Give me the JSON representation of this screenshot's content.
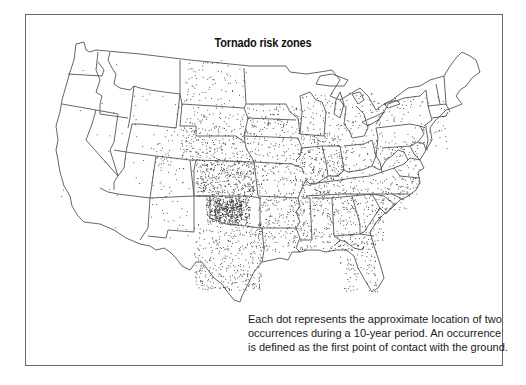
{
  "map": {
    "title": "Tornado risk zones",
    "type": "dot-density",
    "region": "Contiguous United States",
    "caption_lines": [
      "Each dot represents the approximate location of two",
      "occurrences during a 10-year period. An occurrence",
      "is defined as the first point of contact with the ground."
    ],
    "legend": {
      "dot_meaning": "approximate location of two occurrences during a 10-year period",
      "occurrence_definition": "first point of contact with the ground"
    },
    "colors": {
      "outline": "#555555",
      "dots": "#333333",
      "frame": "#6a6a6a",
      "background": "#ffffff"
    },
    "density_zones": [
      {
        "zone": "Oklahoma core",
        "density": "very high"
      },
      {
        "zone": "Kansas / north Texas / Great Plains",
        "density": "high"
      },
      {
        "zone": "Midwest / Southeast",
        "density": "medium-high"
      },
      {
        "zone": "Northeast",
        "density": "medium-low"
      },
      {
        "zone": "Mountain West",
        "density": "low"
      },
      {
        "zone": "Pacific coast",
        "density": "very low"
      }
    ]
  }
}
